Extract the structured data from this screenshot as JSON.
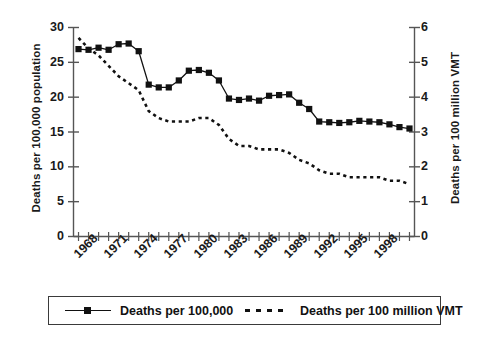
{
  "chart_data": {
    "type": "line",
    "title": "",
    "subtitle": "",
    "xlabel": "",
    "grid": false,
    "legend_position": "bottom",
    "x": [
      1967,
      1968,
      1969,
      1970,
      1971,
      1972,
      1973,
      1974,
      1975,
      1976,
      1977,
      1978,
      1979,
      1980,
      1981,
      1982,
      1983,
      1984,
      1985,
      1986,
      1987,
      1988,
      1989,
      1990,
      1991,
      1992,
      1993,
      1994,
      1995,
      1996,
      1997,
      1998,
      1999,
      2000
    ],
    "xtick_labels": [
      "1968",
      "1971",
      "1974",
      "1977",
      "1980",
      "1983",
      "1986",
      "1989",
      "1992",
      "1995",
      "1998"
    ],
    "xtick_values": [
      1968,
      1971,
      1974,
      1977,
      1980,
      1983,
      1986,
      1989,
      1992,
      1995,
      1998
    ],
    "xlim": [
      1966.5,
      2000.5
    ],
    "series": [
      {
        "name": "Deaths per 100,000",
        "axis": "left",
        "style": "solid-with-square-markers",
        "color": "#111111",
        "ylabel": "Deaths per 100,000 population",
        "ylim": [
          0,
          30
        ],
        "yticks": [
          0,
          5,
          10,
          15,
          20,
          25,
          30
        ],
        "values": [
          26.9,
          26.8,
          27.1,
          26.8,
          27.6,
          27.7,
          26.6,
          21.8,
          21.4,
          21.4,
          22.4,
          23.8,
          23.9,
          23.5,
          22.4,
          19.8,
          19.6,
          19.8,
          19.5,
          20.2,
          20.3,
          20.4,
          19.2,
          18.3,
          16.5,
          16.4,
          16.3,
          16.4,
          16.6,
          16.5,
          16.4,
          16.1,
          15.7,
          15.5
        ]
      },
      {
        "name": "Deaths per 100 million VMT",
        "axis": "right",
        "style": "dotted",
        "color": "#111111",
        "ylabel": "Deaths per 100 million VMT",
        "ylim": [
          0,
          6
        ],
        "yticks": [
          0,
          1,
          2,
          3,
          4,
          5,
          6
        ],
        "values": [
          5.7,
          5.4,
          5.2,
          4.9,
          4.6,
          4.4,
          4.2,
          3.6,
          3.4,
          3.3,
          3.3,
          3.3,
          3.4,
          3.4,
          3.2,
          2.8,
          2.6,
          2.6,
          2.5,
          2.5,
          2.5,
          2.4,
          2.2,
          2.1,
          1.9,
          1.8,
          1.8,
          1.7,
          1.7,
          1.7,
          1.7,
          1.6,
          1.6,
          1.5
        ]
      }
    ]
  },
  "axes": {
    "left": {
      "title": "Deaths per 100,000 population",
      "ticks": [
        "30",
        "25",
        "20",
        "15",
        "10",
        "5",
        "0"
      ]
    },
    "right": {
      "title": "Deaths per 100 million VMT",
      "ticks": [
        "6",
        "5",
        "4",
        "3",
        "2",
        "1",
        "0"
      ]
    },
    "x": {
      "ticks": [
        "1968",
        "1971",
        "1974",
        "1977",
        "1980",
        "1983",
        "1986",
        "1989",
        "1992",
        "1995",
        "1998"
      ]
    }
  },
  "legend": {
    "items": [
      {
        "label": "Deaths per 100,000",
        "marker": "line-square"
      },
      {
        "label": "Deaths per 100 million VMT",
        "marker": "dotted"
      }
    ]
  }
}
